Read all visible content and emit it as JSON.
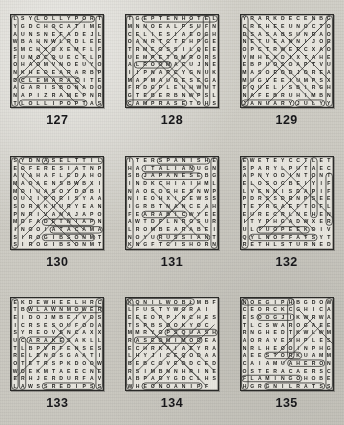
{
  "page": {
    "background_color": "#cfcdc6",
    "paper_color": "#e7e5de",
    "ink_color": "#1d1d1b",
    "grid_size": 12,
    "columns": 3,
    "rows": 3
  },
  "puzzles": [
    {
      "number": "127",
      "theme": "sweets",
      "rows": [
        "LSYLOLLYPORT",
        "YGDCHOCATIME",
        "AUNSNEFADEJL",
        "WBAHNWLRDLEE",
        "SMCHXOXEMFLF",
        "FUMOCQUECFLP",
        "OHAOMVNOEUYO",
        "NKHEOEARARBP",
        "DCLEMARACITE",
        "AGARISBONADO",
        "NAPIZRAMEPNR",
        "TLOLLIPOPTAS"
      ],
      "marks": [
        {
          "type": "oval",
          "r": 0,
          "c": 3,
          "len": 8,
          "dir": "h"
        },
        {
          "type": "oval",
          "r": 11,
          "c": 1,
          "len": 9,
          "dir": "h"
        },
        {
          "type": "oval",
          "r": 8,
          "c": 1,
          "len": 8,
          "dir": "h"
        },
        {
          "type": "oval",
          "r": 0,
          "c": 0,
          "len": 12,
          "dir": "v"
        },
        {
          "type": "oval",
          "r": 0,
          "c": 11,
          "len": 12,
          "dir": "v"
        },
        {
          "type": "line",
          "r1": 0,
          "c1": 9,
          "r2": 8,
          "c2": 1
        },
        {
          "type": "line",
          "r1": 2,
          "c1": 6,
          "r2": 8,
          "c2": 0
        },
        {
          "type": "line",
          "r1": 3,
          "c1": 3,
          "r2": 9,
          "c2": 9
        },
        {
          "type": "line",
          "r1": 4,
          "c1": 3,
          "r2": 10,
          "c2": 9
        },
        {
          "type": "line",
          "r1": 5,
          "c1": 2,
          "r2": 11,
          "c2": 8
        },
        {
          "type": "line",
          "r1": 1,
          "c1": 5,
          "r2": 7,
          "c2": 11
        }
      ]
    },
    {
      "number": "128",
      "theme": "accommodation",
      "rows": [
        "TGEPTENHOTEL",
        "MNNOEALPSUFN",
        "CELIESIAEOGH",
        "OANRTCTEHPGE",
        "TRMEOSSILQEE",
        "UEMPETOMRORS",
        "ALROOMACUJNE",
        "IIPNARCYGNUK",
        "MAPMAUOESEGA",
        "FRDGPLEUHWUT",
        "GTEBERBNWPSL",
        "CAMPRASETOHS"
      ],
      "marks": [
        {
          "type": "oval",
          "r": 0,
          "c": 2,
          "len": 10,
          "dir": "h"
        },
        {
          "type": "oval",
          "r": 11,
          "c": 0,
          "len": 8,
          "dir": "h"
        },
        {
          "type": "oval",
          "r": 6,
          "c": 1,
          "len": 5,
          "dir": "h"
        },
        {
          "type": "oval",
          "r": 0,
          "c": 10,
          "len": 12,
          "dir": "v"
        },
        {
          "type": "oval",
          "r": 0,
          "c": 0,
          "len": 12,
          "dir": "v"
        },
        {
          "type": "line",
          "r1": 1,
          "c1": 2,
          "r2": 9,
          "c2": 10
        },
        {
          "type": "line",
          "r1": 2,
          "c1": 1,
          "r2": 10,
          "c2": 9
        },
        {
          "type": "line",
          "r1": 3,
          "c1": 1,
          "r2": 11,
          "c2": 9
        },
        {
          "type": "line",
          "r1": 0,
          "c1": 8,
          "r2": 8,
          "c2": 0
        },
        {
          "type": "line",
          "r1": 1,
          "c1": 9,
          "r2": 9,
          "c2": 1
        },
        {
          "type": "line",
          "r1": 2,
          "c1": 10,
          "r2": 10,
          "c2": 2
        },
        {
          "type": "line",
          "r1": 4,
          "c1": 9,
          "r2": 11,
          "c2": 2
        }
      ]
    },
    {
      "number": "129",
      "theme": "months",
      "rows": [
        "YRARKDECENBG",
        "CREHEEUNOCTO",
        "DSASABSUNDAO",
        "NETUEANNIJOR",
        "OPCTRWEECXAO",
        "VMHEXDIXTAHE",
        "EBPUOSOAPTVU",
        "MASOEODJOREA",
        "MUGVEEIUMPSX",
        "EQUELISBIRGH",
        "NAFEBRUHIMBN",
        "JANUARYJULYY"
      ],
      "marks": [
        {
          "type": "oval",
          "r": 11,
          "c": 0,
          "len": 7,
          "dir": "h"
        },
        {
          "type": "oval",
          "r": 11,
          "c": 7,
          "len": 4,
          "dir": "h"
        },
        {
          "type": "oval",
          "r": 0,
          "c": 0,
          "len": 12,
          "dir": "v"
        },
        {
          "type": "oval",
          "r": 0,
          "c": 11,
          "len": 12,
          "dir": "v"
        },
        {
          "type": "line",
          "r1": 0,
          "c1": 3,
          "r2": 8,
          "c2": 11
        },
        {
          "type": "line",
          "r1": 0,
          "c1": 1,
          "r2": 9,
          "c2": 10
        },
        {
          "type": "line",
          "r1": 1,
          "c1": 0,
          "r2": 10,
          "c2": 9
        },
        {
          "type": "line",
          "r1": 2,
          "c1": 0,
          "r2": 11,
          "c2": 9
        },
        {
          "type": "line",
          "r1": 0,
          "c1": 9,
          "r2": 9,
          "c2": 0
        },
        {
          "type": "line",
          "r1": 0,
          "c1": 11,
          "r2": 11,
          "c2": 0
        },
        {
          "type": "line",
          "r1": 1,
          "c1": 10,
          "r2": 10,
          "c2": 1
        },
        {
          "type": "line",
          "r1": 3,
          "c1": 11,
          "r2": 11,
          "c2": 3
        }
      ]
    },
    {
      "number": "130",
      "theme": "places",
      "rows": [
        "SYDNASELTTIL",
        "EOFERESIATNP",
        "AVAHAFLEDAHO",
        "MAOAENSBWBXI",
        "MOIUASOYDOBI",
        "OUJIPORISYAA",
        "SORAKUURYEAN",
        "PNRIVANAJAPO",
        "MDFADETNIAPN",
        "INOOIATACAMA",
        "SIROGIBSONMT",
        "SIROGIBSONMT"
      ],
      "marks": [
        {
          "type": "oval",
          "r": 0,
          "c": 1,
          "len": 4,
          "dir": "h"
        },
        {
          "type": "oval",
          "r": 0,
          "c": 4,
          "len": 8,
          "dir": "h"
        },
        {
          "type": "oval",
          "r": 8,
          "c": 4,
          "len": 7,
          "dir": "h"
        },
        {
          "type": "oval",
          "r": 9,
          "c": 5,
          "len": 7,
          "dir": "h"
        },
        {
          "type": "oval",
          "r": 10,
          "c": 4,
          "len": 7,
          "dir": "h"
        },
        {
          "type": "oval",
          "r": 0,
          "c": 0,
          "len": 12,
          "dir": "v"
        },
        {
          "type": "line",
          "r1": 1,
          "c1": 1,
          "r2": 9,
          "c2": 9
        },
        {
          "type": "line",
          "r1": 2,
          "c1": 1,
          "r2": 10,
          "c2": 9
        },
        {
          "type": "line",
          "r1": 3,
          "c1": 0,
          "r2": 11,
          "c2": 8
        },
        {
          "type": "line",
          "r1": 1,
          "c1": 8,
          "r2": 9,
          "c2": 0
        },
        {
          "type": "line",
          "r1": 2,
          "c1": 9,
          "r2": 10,
          "c2": 1
        },
        {
          "type": "line",
          "r1": 3,
          "c1": 10,
          "r2": 11,
          "c2": 2
        }
      ]
    },
    {
      "number": "131",
      "theme": "languages",
      "rows": [
        "ITERSPANISHE",
        "HAITALIANUGN",
        "SBJAPANESEBG",
        "INDKCHIAIHML",
        "NAOEOGHESNWP",
        "NIEOHXICEWSS",
        "IGRBTNANCEAH",
        "FEARABICWYEE",
        "AWTDFLNROSUR",
        "LROMBEARABEI",
        "NOYURUSSIANT",
        "KNGFTCISHORN"
      ],
      "marks": [
        {
          "type": "oval",
          "r": 0,
          "c": 4,
          "len": 7,
          "dir": "h"
        },
        {
          "type": "oval",
          "r": 1,
          "c": 2,
          "len": 7,
          "dir": "h"
        },
        {
          "type": "oval",
          "r": 2,
          "c": 2,
          "len": 8,
          "dir": "h"
        },
        {
          "type": "oval",
          "r": 7,
          "c": 2,
          "len": 6,
          "dir": "h"
        },
        {
          "type": "oval",
          "r": 10,
          "c": 4,
          "len": 7,
          "dir": "h"
        },
        {
          "type": "oval",
          "r": 0,
          "c": 0,
          "len": 12,
          "dir": "v"
        },
        {
          "type": "oval",
          "r": 0,
          "c": 11,
          "len": 12,
          "dir": "v"
        },
        {
          "type": "line",
          "r1": 3,
          "c1": 4,
          "r2": 9,
          "c2": 10
        },
        {
          "type": "line",
          "r1": 4,
          "c1": 3,
          "r2": 10,
          "c2": 9
        },
        {
          "type": "line",
          "r1": 3,
          "c1": 9,
          "r2": 9,
          "c2": 3
        },
        {
          "type": "line",
          "r1": 4,
          "c1": 8,
          "r2": 11,
          "c2": 1
        },
        {
          "type": "line",
          "r1": 6,
          "c1": 10,
          "r2": 11,
          "c2": 5
        }
      ]
    },
    {
      "number": "132",
      "theme": "tennis",
      "rows": [
        "EWETEYCCTLET",
        "SPARYLPUTAEC",
        "APNYOOINTONT",
        "ELOSOCBEIYIF",
        "LVENNISDAPIF",
        "PDRSSDRNPSEE",
        "TETRGAEFTOFL",
        "EURECRLNEHEN",
        "ITYPHGADWXER",
        "ULTUOPEEKOIV",
        "QYLNOFFATSYT",
        "RETHLSTURNED"
      ],
      "marks": [
        {
          "type": "oval",
          "r": 9,
          "c": 2,
          "len": 7,
          "dir": "h"
        },
        {
          "type": "oval",
          "r": 10,
          "c": 1,
          "len": 9,
          "dir": "h"
        },
        {
          "type": "oval",
          "r": 0,
          "c": 0,
          "len": 12,
          "dir": "v"
        },
        {
          "type": "oval",
          "r": 0,
          "c": 9,
          "len": 8,
          "dir": "v"
        },
        {
          "type": "oval",
          "r": 2,
          "c": 11,
          "len": 7,
          "dir": "v"
        },
        {
          "type": "line",
          "r1": 1,
          "c1": 5,
          "r2": 8,
          "c2": 12
        },
        {
          "type": "line",
          "r1": 2,
          "c1": 2,
          "r2": 9,
          "c2": 9
        },
        {
          "type": "line",
          "r1": 3,
          "c1": 1,
          "r2": 10,
          "c2": 8
        },
        {
          "type": "line",
          "r1": 0,
          "c1": 8,
          "r2": 8,
          "c2": 0
        },
        {
          "type": "line",
          "r1": 2,
          "c1": 9,
          "r2": 9,
          "c2": 2
        },
        {
          "type": "line",
          "r1": 4,
          "c1": 9,
          "r2": 10,
          "c2": 3
        }
      ]
    },
    {
      "number": "133",
      "theme": "garden tools",
      "rows": [
        "EKDEWHEELHRC",
        "TBWLAWNMOWER",
        "EIDOJMBEIVDS",
        "ICRSESOUFODA",
        "SYREOVSNCAXX",
        "UCARAKESAKLL",
        "TLBPVRFENSES",
        "RELENOSGAATI",
        "OTETRSPKDOOW",
        "WOEKMTAEECNE",
        "ERHJERDURFAV",
        "LAWSSREDIPSS"
      ],
      "marks": [
        {
          "type": "oval",
          "r": 1,
          "c": 2,
          "len": 10,
          "dir": "h"
        },
        {
          "type": "oval",
          "r": 5,
          "c": 2,
          "len": 5,
          "dir": "h"
        },
        {
          "type": "oval",
          "r": 11,
          "c": 4,
          "len": 7,
          "dir": "h"
        },
        {
          "type": "oval",
          "r": 0,
          "c": 0,
          "len": 12,
          "dir": "v"
        },
        {
          "type": "oval",
          "r": 0,
          "c": 11,
          "len": 12,
          "dir": "v"
        },
        {
          "type": "oval",
          "r": 5,
          "c": 1,
          "len": 7,
          "dir": "v"
        },
        {
          "type": "line",
          "r1": 1,
          "c1": 9,
          "r2": 8,
          "c2": 2
        },
        {
          "type": "line",
          "r1": 2,
          "c1": 10,
          "r2": 9,
          "c2": 3
        },
        {
          "type": "line",
          "r1": 4,
          "c1": 6,
          "r2": 10,
          "c2": 0
        },
        {
          "type": "line",
          "r1": 3,
          "c1": 5,
          "r2": 9,
          "c2": 11
        }
      ]
    },
    {
      "number": "134",
      "theme": "vegetables",
      "rows": [
        "KQNILWOBLMBF",
        "LFUSTYWORAI",
        "EEEOPPINCHES",
        "TSPBSOOKYOC",
        "MMRYOPSQUASH",
        "RASEOMIMODEA",
        "ECHRKAIAEYRA",
        "LHYJICEQODAA",
        "BEBCOVEODCED",
        "RSIMBNNHRINE",
        "ABPADYGDCLHS",
        "WHEONOANIPF"
      ],
      "marks": [
        {
          "type": "oval",
          "r": 0,
          "c": 0,
          "len": 9,
          "dir": "h"
        },
        {
          "type": "oval",
          "r": 4,
          "c": 5,
          "len": 7,
          "dir": "h"
        },
        {
          "type": "oval",
          "r": 5,
          "c": 1,
          "len": 9,
          "dir": "h"
        },
        {
          "type": "oval",
          "r": 11,
          "c": 2,
          "len": 8,
          "dir": "h"
        },
        {
          "type": "oval",
          "r": 0,
          "c": 0,
          "len": 12,
          "dir": "v"
        },
        {
          "type": "line",
          "r1": 0,
          "c1": 8,
          "r2": 8,
          "c2": 0
        },
        {
          "type": "line",
          "r1": 1,
          "c1": 9,
          "r2": 9,
          "c2": 1
        },
        {
          "type": "line",
          "r1": 2,
          "c1": 10,
          "r2": 10,
          "c2": 2
        },
        {
          "type": "line",
          "r1": 3,
          "c1": 11,
          "r2": 11,
          "c2": 3
        },
        {
          "type": "line",
          "r1": 2,
          "c1": 1,
          "r2": 10,
          "c2": 9
        },
        {
          "type": "line",
          "r1": 3,
          "c1": 2,
          "r2": 11,
          "c2": 10
        },
        {
          "type": "line",
          "r1": 1,
          "c1": 3,
          "r2": 9,
          "c2": 11
        }
      ]
    },
    {
      "number": "135",
      "theme": "birds",
      "rows": [
        "NOEGIPHBGDOW",
        "CEORCKCGHICA",
        "ESOOGJIKWRWA",
        "TLCSWAROGAEE",
        "RNGHEDTKWLWM",
        "AORAVESHPLES",
        "NRLHEOOINPHG",
        "AEESTORKUAMM",
        "CAIAMUAHERON",
        "OSTERACAERSC",
        "FLAMINGOHOBE",
        "HGRGNILRATSS"
      ],
      "marks": [
        {
          "type": "oval",
          "r": 0,
          "c": 0,
          "len": 7,
          "dir": "h"
        },
        {
          "type": "oval",
          "r": 2,
          "c": 2,
          "len": 5,
          "dir": "h"
        },
        {
          "type": "oval",
          "r": 7,
          "c": 3,
          "len": 5,
          "dir": "h"
        },
        {
          "type": "oval",
          "r": 8,
          "c": 6,
          "len": 5,
          "dir": "h"
        },
        {
          "type": "oval",
          "r": 10,
          "c": 0,
          "len": 8,
          "dir": "h"
        },
        {
          "type": "oval",
          "r": 11,
          "c": 3,
          "len": 8,
          "dir": "h"
        },
        {
          "type": "oval",
          "r": 0,
          "c": 0,
          "len": 12,
          "dir": "v"
        },
        {
          "type": "oval",
          "r": 0,
          "c": 11,
          "len": 12,
          "dir": "v"
        },
        {
          "type": "oval",
          "r": 0,
          "c": 6,
          "len": 8,
          "dir": "v"
        },
        {
          "type": "line",
          "r1": 1,
          "c1": 7,
          "r2": 6,
          "c2": 12
        },
        {
          "type": "line",
          "r1": 2,
          "c1": 9,
          "r2": 7,
          "c2": 4
        },
        {
          "type": "line",
          "r1": 3,
          "c1": 10,
          "r2": 8,
          "c2": 5
        }
      ]
    }
  ]
}
